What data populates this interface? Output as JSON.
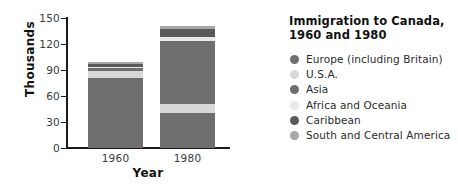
{
  "chart_data": {
    "type": "bar",
    "subtype": "stacked",
    "title": "Immigration to Canada, 1960 and 1980",
    "title_line1": "Immigration to Canada,",
    "title_line2": "1960 and 1980",
    "xlabel": "Year",
    "ylabel": "Thousands",
    "categories": [
      "1960",
      "1980"
    ],
    "yticks": [
      0,
      30,
      60,
      90,
      120,
      150
    ],
    "ylim": [
      0,
      150
    ],
    "grid": false,
    "legend_position": "right",
    "series": [
      {
        "name": "Europe (including Britain)",
        "color": "#6e6e6e",
        "values": [
          81,
          40
        ]
      },
      {
        "name": "U.S.A.",
        "color": "#d8d8d8",
        "values": [
          8,
          11
        ]
      },
      {
        "name": "Asia",
        "color": "#6e6e6e",
        "values": [
          3,
          72
        ]
      },
      {
        "name": "Africa and Oceania",
        "color": "#e9e9e9",
        "values": [
          2,
          5
        ]
      },
      {
        "name": "Caribbean",
        "color": "#5a5a5a",
        "values": [
          3,
          9
        ]
      },
      {
        "name": "South and Central America",
        "color": "#a8a8a8",
        "values": [
          2,
          4
        ]
      }
    ],
    "totals": [
      99,
      141
    ]
  },
  "axes": {
    "y_title": "Thousands",
    "x_title": "Year",
    "y_tick_labels": [
      "150",
      "120",
      "90",
      "60",
      "30",
      "0"
    ],
    "x_tick_labels": [
      "1960",
      "1980"
    ]
  },
  "legend": {
    "items": [
      {
        "label": "Europe (including Britain)",
        "color": "#6e6e6e"
      },
      {
        "label": "U.S.A.",
        "color": "#d8d8d8"
      },
      {
        "label": "Asia",
        "color": "#6e6e6e"
      },
      {
        "label": "Africa and Oceania",
        "color": "#e9e9e9"
      },
      {
        "label": "Caribbean",
        "color": "#5a5a5a"
      },
      {
        "label": "South and Central America",
        "color": "#a8a8a8"
      }
    ]
  },
  "title": {
    "line1": "Immigration to Canada,",
    "line2": "1960 and 1980"
  }
}
